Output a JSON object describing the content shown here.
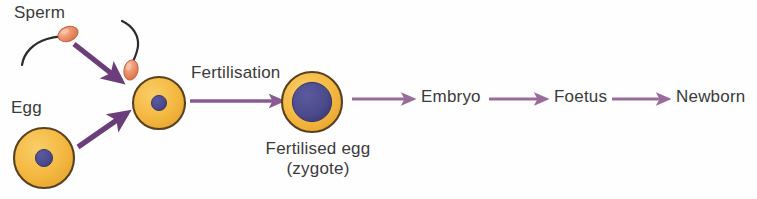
{
  "diagram": {
    "background_color": "#fefefe",
    "text_color": "#3a3a3a",
    "labels": {
      "sperm": "Sperm",
      "egg": "Egg",
      "fertilisation": "Fertilisation",
      "fertilised_egg_line1": "Fertilised egg",
      "fertilised_egg_line2": "(zygote)",
      "embryo": "Embryo",
      "foetus": "Foetus",
      "newborn": "Newborn"
    },
    "colors": {
      "cell_fill": "#f4b942",
      "cell_fill_light": "#f7c95e",
      "cell_outline": "#5a4020",
      "nucleus": "#4a4a8c",
      "nucleus_dark": "#403f7d",
      "sperm_head": "#e8825a",
      "sperm_head_light": "#f2a98a",
      "sperm_tail": "#2b2b2b",
      "arrow_thick": "#6b3d7a",
      "arrow_thin": "#9b6b9b"
    },
    "stages": [
      {
        "name": "sperm",
        "label": "Sperm"
      },
      {
        "name": "egg",
        "label": "Egg"
      },
      {
        "name": "fertilisation",
        "label": "Fertilisation"
      },
      {
        "name": "zygote",
        "label": "Fertilised egg (zygote)"
      },
      {
        "name": "embryo",
        "label": "Embryo"
      },
      {
        "name": "foetus",
        "label": "Foetus"
      },
      {
        "name": "newborn",
        "label": "Newborn"
      }
    ]
  }
}
